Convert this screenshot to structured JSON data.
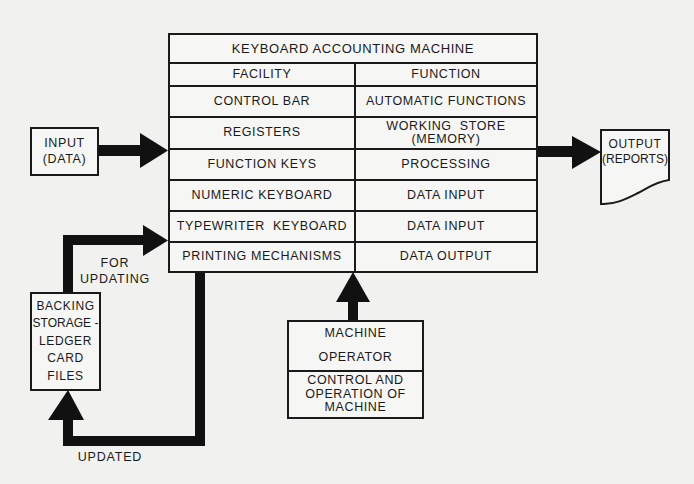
{
  "title": "KEYBOARD ACCOUNTING MACHINE",
  "table": {
    "headers": {
      "facility": "FACILITY",
      "function": "FUNCTION"
    },
    "rows": [
      {
        "facility": "CONTROL BAR",
        "function": "AUTOMATIC FUNCTIONS"
      },
      {
        "facility": "REGISTERS",
        "function_line1": "WORKING  STORE",
        "function_line2": "(MEMORY)"
      },
      {
        "facility": "FUNCTION KEYS",
        "function": "PROCESSING"
      },
      {
        "facility": "NUMERIC KEYBOARD",
        "function": "DATA INPUT"
      },
      {
        "facility": "TYPEWRITER  KEYBOARD",
        "function": "DATA INPUT"
      },
      {
        "facility": "PRINTING MECHANISMS",
        "function": "DATA OUTPUT"
      }
    ]
  },
  "input_box": {
    "line1": "INPUT",
    "line2": "(DATA)"
  },
  "output_doc": {
    "line1": "OUTPUT",
    "line2": "(REPORTS)"
  },
  "backing_storage": {
    "lines": [
      "BACKING",
      "STORAGE -",
      "LEDGER",
      "CARD",
      "FILES"
    ]
  },
  "operator_box": {
    "top_line1": "MACHINE",
    "top_line2": "OPERATOR",
    "bottom_lines": [
      "CONTROL AND",
      "OPERATION OF",
      "MACHINE"
    ]
  },
  "labels": {
    "for_updating_line1": "FOR",
    "for_updating_line2": "UPDATING",
    "updated": "UPDATED"
  },
  "colors": {
    "ink": "#1a1a1a",
    "paper": "#f1f1ef"
  }
}
